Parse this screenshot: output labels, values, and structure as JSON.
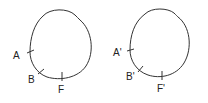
{
  "diagram": {
    "left": {
      "labels": {
        "a": "A",
        "b": "B",
        "f": "F"
      }
    },
    "right": {
      "labels": {
        "a": "A'",
        "b": "B'",
        "f": "F'"
      }
    }
  }
}
